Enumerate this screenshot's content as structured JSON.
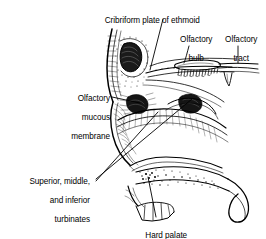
{
  "figure": {
    "background_color": "#ffffff",
    "ink_color": "#000000"
  },
  "labels": [
    {
      "id": "cribriform-plate",
      "text": "Cribriform plate of ethmoid",
      "lines": [
        "Cribriform plate of ethmoid"
      ],
      "align": "center",
      "x": 86,
      "y": 6,
      "width": 128
    },
    {
      "id": "olfactory-bulb",
      "text": "Olfactory bulb",
      "lines": [
        "Olfactory",
        "bulb"
      ],
      "align": "center",
      "x": 168,
      "y": 25,
      "width": 52
    },
    {
      "id": "olfactory-tract",
      "text": "Olfactory tract",
      "lines": [
        "Olfactory",
        "tract"
      ],
      "align": "center",
      "x": 214,
      "y": 25,
      "width": 50
    },
    {
      "id": "olfactory-mucous-membrane",
      "text": "Olfactory mucous membrane",
      "lines": [
        "Olfactory",
        "mucous",
        "membrane"
      ],
      "align": "right",
      "x": 34,
      "y": 84,
      "width": 76
    },
    {
      "id": "turbinates",
      "text": "Superior, middle, and inferior turbinates",
      "lines": [
        "Superior, middle,",
        "and inferior",
        "turbinates"
      ],
      "align": "right",
      "x": 4,
      "y": 167,
      "width": 86
    },
    {
      "id": "hard-palate",
      "text": "Hard palate",
      "lines": [
        "Hard palate"
      ],
      "align": "center",
      "x": 134,
      "y": 221,
      "width": 60
    }
  ],
  "structures": [
    {
      "id": "frontal-sinus",
      "name": "frontal sinus"
    },
    {
      "id": "cribriform-plate-structure",
      "name": "cribriform plate of ethmoid"
    },
    {
      "id": "olfactory-bulb-structure",
      "name": "olfactory bulb"
    },
    {
      "id": "olfactory-tract-structure",
      "name": "olfactory tract"
    },
    {
      "id": "olfactory-nerve-filaments",
      "name": "olfactory nerve filaments"
    },
    {
      "id": "superior-turbinate",
      "name": "superior turbinate"
    },
    {
      "id": "middle-turbinate",
      "name": "middle turbinate"
    },
    {
      "id": "inferior-turbinate",
      "name": "inferior turbinate"
    },
    {
      "id": "hard-palate-structure",
      "name": "hard palate"
    },
    {
      "id": "soft-palate",
      "name": "soft palate and uvula"
    },
    {
      "id": "teeth",
      "name": "upper teeth"
    },
    {
      "id": "nasal-bridge",
      "name": "nasal bridge and forehead profile"
    }
  ]
}
